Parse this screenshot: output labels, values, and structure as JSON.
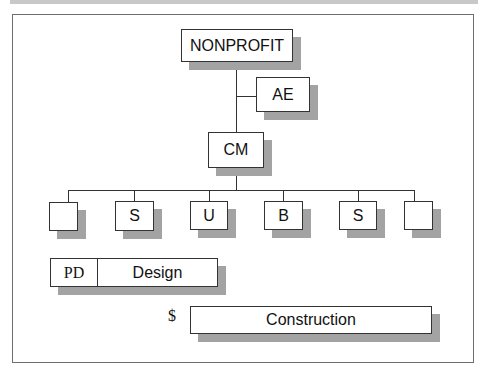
{
  "diagram": {
    "top": "NONPROFIT",
    "advisor": "AE",
    "manager": "CM",
    "consultants": [
      "",
      "S",
      "U",
      "B",
      "S",
      ""
    ],
    "phases": {
      "design": {
        "prefix": "PD",
        "label": "Design"
      },
      "construction": {
        "prefix": "$",
        "label": "Construction"
      }
    }
  },
  "colors": {
    "line": "#333333",
    "shadow": "#a3a3a3",
    "frame": "#6e6e6e",
    "topbar": "#c8c8c8"
  }
}
